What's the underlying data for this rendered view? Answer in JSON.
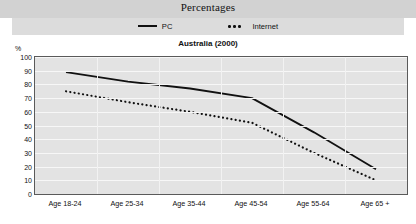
{
  "banner": {
    "title": "Percentages"
  },
  "legend": {
    "items": [
      {
        "label": "PC",
        "style": "solid",
        "color": "#111111"
      },
      {
        "label": "Internet",
        "style": "dotted",
        "color": "#111111"
      }
    ]
  },
  "chart_data": {
    "type": "line",
    "title": "Australia (2000)",
    "xlabel": "",
    "ylabel": "%",
    "ylim": [
      0,
      100
    ],
    "yticks": [
      0,
      10,
      20,
      30,
      40,
      50,
      60,
      70,
      80,
      90,
      100
    ],
    "grid": true,
    "legend_position": "top",
    "categories": [
      "Age 18-24",
      "Age 25-34",
      "Age 35-44",
      "Age 45-54",
      "Age 55-64",
      "Age 65 +"
    ],
    "series": [
      {
        "name": "PC",
        "style": "solid",
        "values": [
          89,
          82,
          77,
          70,
          45,
          18
        ]
      },
      {
        "name": "Internet",
        "style": "dotted",
        "values": [
          75,
          67,
          60,
          52,
          30,
          10
        ]
      }
    ]
  }
}
